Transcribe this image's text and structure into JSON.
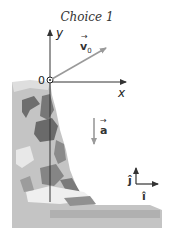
{
  "title": "Choice 1",
  "axes": {
    "x_label": "x",
    "y_label": "y",
    "origin_label": "0"
  },
  "vectors": {
    "velocity": {
      "label": "v",
      "subscript": "0",
      "direction": "up-right",
      "color": "#9a9a9a"
    },
    "acceleration": {
      "label": "a",
      "direction": "down",
      "color": "#9a9a9a"
    }
  },
  "unit_vectors": {
    "i_label": "î",
    "j_label": "ĵ"
  },
  "colors": {
    "axis": "#333333",
    "vector": "#9a9a9a",
    "cliff_light": "#c9c9c9",
    "cliff_mid": "#a8a8a8",
    "cliff_dark": "#6e6e6e"
  }
}
